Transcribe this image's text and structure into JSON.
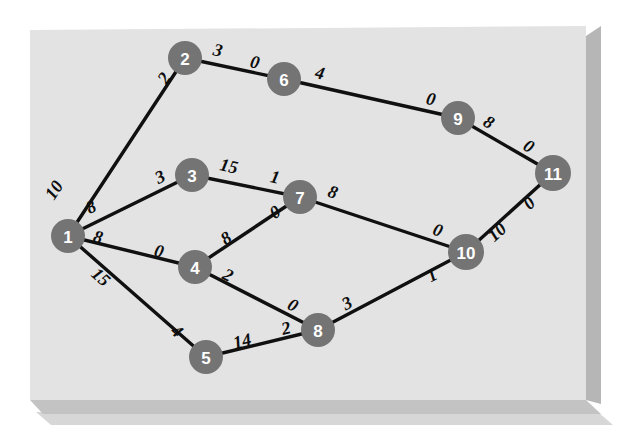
{
  "figure": {
    "background_color": "#ffffff",
    "panel_color": "#e3e3e3",
    "node_color": "#747474",
    "node_text_color": "#ffffff",
    "edge_color": "#101010",
    "weight_text_color": "#0d0d0d"
  },
  "chart_data": {
    "type": "diagram",
    "subtype": "node-link-graph",
    "title": "",
    "directed": false,
    "node_count": 11,
    "edge_count": 14,
    "nodes": [
      {
        "id": "1",
        "label": "1",
        "x": 68,
        "y": 236,
        "r": 17
      },
      {
        "id": "2",
        "label": "2",
        "x": 185,
        "y": 58,
        "r": 17
      },
      {
        "id": "3",
        "label": "3",
        "x": 192,
        "y": 175,
        "r": 17
      },
      {
        "id": "4",
        "label": "4",
        "x": 195,
        "y": 267,
        "r": 17
      },
      {
        "id": "5",
        "label": "5",
        "x": 206,
        "y": 357,
        "r": 17
      },
      {
        "id": "6",
        "label": "6",
        "x": 284,
        "y": 79,
        "r": 17
      },
      {
        "id": "7",
        "label": "7",
        "x": 300,
        "y": 197,
        "r": 17
      },
      {
        "id": "8",
        "label": "8",
        "x": 318,
        "y": 330,
        "r": 17
      },
      {
        "id": "9",
        "label": "9",
        "x": 458,
        "y": 118,
        "r": 17
      },
      {
        "id": "10",
        "label": "10",
        "x": 466,
        "y": 252,
        "r": 18
      },
      {
        "id": "11",
        "label": "11",
        "x": 553,
        "y": 173,
        "r": 18
      }
    ],
    "edges": [
      {
        "source": "1",
        "target": "2",
        "source_weight": "10",
        "target_weight": "2",
        "source_label_x": 54,
        "source_label_y": 190,
        "target_label_x": 164,
        "target_label_y": 78
      },
      {
        "source": "1",
        "target": "3",
        "source_weight": "8",
        "target_weight": "3",
        "source_label_x": 91,
        "source_label_y": 207,
        "target_label_x": 160,
        "target_label_y": 177
      },
      {
        "source": "1",
        "target": "4",
        "source_weight": "8",
        "target_weight": "0",
        "source_label_x": 98,
        "source_label_y": 237,
        "target_label_x": 159,
        "target_label_y": 251
      },
      {
        "source": "1",
        "target": "5",
        "source_weight": "15",
        "target_weight": "4",
        "source_label_x": 101,
        "source_label_y": 277,
        "target_label_x": 177,
        "target_label_y": 331
      },
      {
        "source": "2",
        "target": "6",
        "source_weight": "3",
        "target_weight": "0",
        "source_label_x": 218,
        "source_label_y": 50,
        "target_label_x": 255,
        "target_label_y": 62
      },
      {
        "source": "3",
        "target": "7",
        "source_weight": "15",
        "target_weight": "1",
        "source_label_x": 229,
        "source_label_y": 166,
        "target_label_x": 275,
        "target_label_y": 177
      },
      {
        "source": "4",
        "target": "7",
        "source_weight": "8",
        "target_weight": "0",
        "source_label_x": 226,
        "source_label_y": 238,
        "target_label_x": 275,
        "target_label_y": 212
      },
      {
        "source": "4",
        "target": "8",
        "source_weight": "2",
        "target_weight": "0",
        "source_label_x": 228,
        "source_label_y": 275,
        "target_label_x": 293,
        "target_label_y": 305
      },
      {
        "source": "5",
        "target": "8",
        "source_weight": "14",
        "target_weight": "2",
        "source_label_x": 242,
        "source_label_y": 341,
        "target_label_x": 286,
        "target_label_y": 328
      },
      {
        "source": "6",
        "target": "9",
        "source_weight": "4",
        "target_weight": "0",
        "source_label_x": 320,
        "source_label_y": 73,
        "target_label_x": 431,
        "target_label_y": 99
      },
      {
        "source": "7",
        "target": "10",
        "source_weight": "8",
        "target_weight": "0",
        "source_label_x": 333,
        "source_label_y": 192,
        "target_label_x": 438,
        "target_label_y": 230
      },
      {
        "source": "8",
        "target": "10",
        "source_weight": "3",
        "target_weight": "1",
        "source_label_x": 347,
        "source_label_y": 303,
        "target_label_x": 432,
        "target_label_y": 275
      },
      {
        "source": "9",
        "target": "11",
        "source_weight": "8",
        "target_weight": "0",
        "source_label_x": 489,
        "source_label_y": 122,
        "target_label_x": 529,
        "target_label_y": 146
      },
      {
        "source": "10",
        "target": "11",
        "source_weight": "10",
        "target_weight": "0",
        "source_label_x": 497,
        "source_label_y": 232,
        "target_label_x": 529,
        "target_label_y": 203
      }
    ],
    "weight_labels": [
      "10",
      "2",
      "8",
      "3",
      "8",
      "0",
      "15",
      "4",
      "3",
      "0",
      "15",
      "1",
      "8",
      "0",
      "2",
      "0",
      "14",
      "2",
      "4",
      "0",
      "8",
      "0",
      "3",
      "1",
      "8",
      "0",
      "10",
      "0"
    ]
  }
}
